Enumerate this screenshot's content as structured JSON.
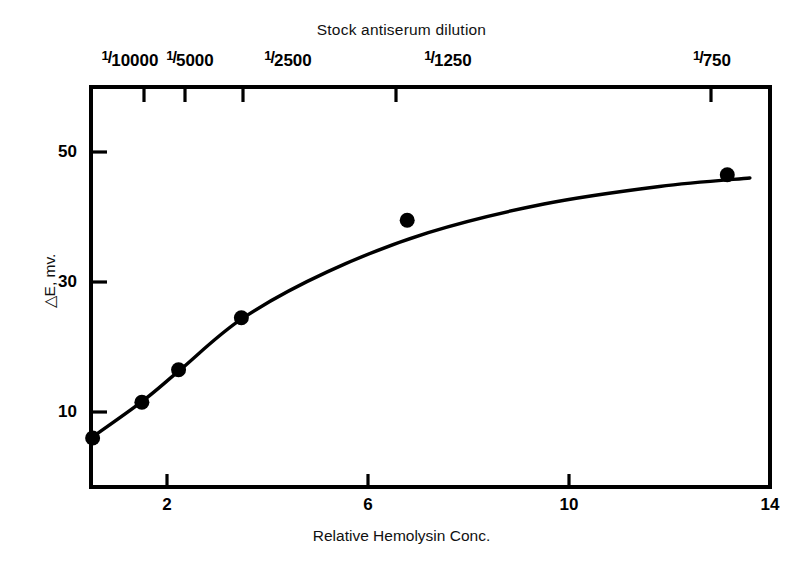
{
  "chart_data": {
    "type": "line",
    "title": "",
    "xlabel": "Relative Hemolysin Conc.",
    "ylabel": "△E, mv.",
    "top_axis_label": "Stock antiserum dilution",
    "xlim": [
      0.2,
      14
    ],
    "ylim": [
      0,
      57
    ],
    "grid": false,
    "legend": "none",
    "x_ticks": [
      "2",
      "6",
      "10",
      "14"
    ],
    "x_tick_values": [
      2,
      6,
      10,
      14
    ],
    "y_ticks": [
      "10",
      "30",
      "50"
    ],
    "y_tick_values": [
      10,
      30,
      50
    ],
    "top_ticks": [
      {
        "numerator": "1",
        "denominator": "10000",
        "x_value": 1.0
      },
      {
        "numerator": "1",
        "denominator": "5000",
        "x_value": 1.95
      },
      {
        "numerator": "1",
        "denominator": "2500",
        "x_value": 3.6
      },
      {
        "numerator": "1",
        "denominator": "1250",
        "x_value": 11.0
      },
      {
        "numerator": "1",
        "denominator": "750",
        "x_value": 11.05
      }
    ],
    "series": [
      {
        "name": "hemolysin response",
        "marker": "filled-circle",
        "color": "#000000",
        "x": [
          0.52,
          1.5,
          2.23,
          3.48,
          6.78,
          13.15
        ],
        "y": [
          6.0,
          11.5,
          16.5,
          24.5,
          39.5,
          46.5
        ]
      }
    ],
    "fitted_curve_note": "smooth saturating curve drawn through the points"
  },
  "labels": {
    "top_axis_title": "Stock antiserum dilution",
    "bottom_axis_title": "Relative Hemolysin Conc.",
    "y_axis_title": "△E, mv."
  }
}
